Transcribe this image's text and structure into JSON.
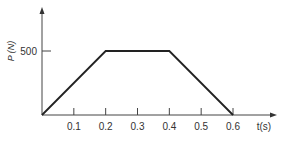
{
  "chart_data": {
    "type": "line",
    "title": "",
    "xlabel": "t(s)",
    "ylabel": "P (N)",
    "x": [
      0,
      0.2,
      0.4,
      0.6
    ],
    "values": [
      0,
      500,
      500,
      0
    ],
    "xticks": [
      "0.1",
      "0.2",
      "0.3",
      "0.4",
      "0.5",
      "0.6"
    ],
    "yticks": [
      "500"
    ],
    "xlim": [
      0,
      0.65
    ],
    "ylim": [
      0,
      700
    ],
    "grid": false,
    "legend": null
  },
  "colors": {
    "line": "#222222",
    "axis": "#444444",
    "text": "#333333"
  }
}
